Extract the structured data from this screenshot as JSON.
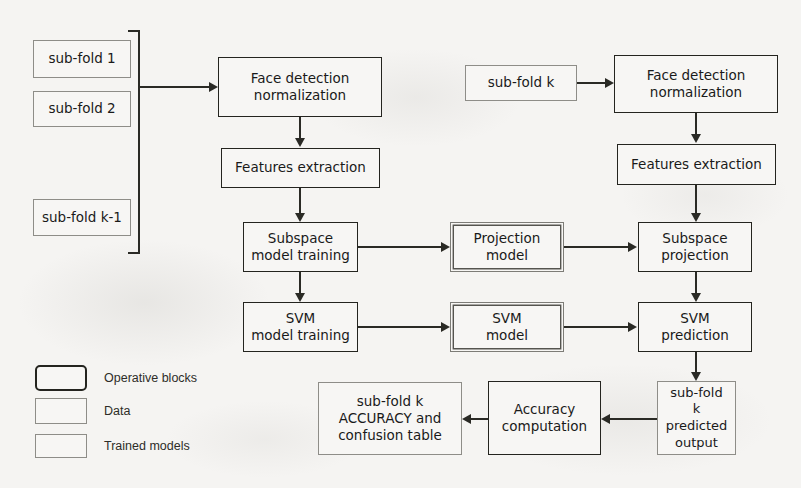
{
  "diagram": {
    "colors": {
      "background": "#f5f4f2",
      "line": "#2a2a25",
      "operative_border": "#24241f",
      "data_border": "#8e8d88",
      "model_border": "#55544f"
    }
  },
  "nodes": {
    "subfold_1": {
      "label": "sub-fold 1",
      "type": "Data"
    },
    "subfold_2": {
      "label": "sub-fold 2",
      "type": "Data"
    },
    "subfold_k_minus_1": {
      "label": "sub-fold k-1",
      "type": "Data"
    },
    "subfold_k": {
      "label": "sub-fold k",
      "type": "Data"
    },
    "train_face_detection": {
      "label": "Face detection\nnormalization",
      "type": "Operative blocks"
    },
    "train_features_extraction": {
      "label": "Features extraction",
      "type": "Operative blocks"
    },
    "subspace_model_training": {
      "label": "Subspace\nmodel training",
      "type": "Operative blocks"
    },
    "svm_model_training": {
      "label": "SVM\nmodel training",
      "type": "Operative blocks"
    },
    "projection_model": {
      "label": "Projection\nmodel",
      "type": "Trained models"
    },
    "svm_model": {
      "label": "SVM\nmodel",
      "type": "Trained models"
    },
    "test_face_detection": {
      "label": "Face detection\nnormalization",
      "type": "Operative blocks"
    },
    "test_features_extraction": {
      "label": "Features extraction",
      "type": "Operative blocks"
    },
    "subspace_projection": {
      "label": "Subspace\nprojection",
      "type": "Operative blocks"
    },
    "svm_prediction": {
      "label": "SVM\nprediction",
      "type": "Operative blocks"
    },
    "predicted_output": {
      "label": "sub-fold\nk\npredicted\noutput",
      "type": "Data"
    },
    "accuracy_computation": {
      "label": "Accuracy\ncomputation",
      "type": "Operative blocks"
    },
    "accuracy_result": {
      "label": "sub-fold k\nACCURACY and\nconfusion table",
      "type": "Data"
    }
  },
  "legend": {
    "items": [
      {
        "label": "Operative blocks",
        "swatch": "operative-swatch"
      },
      {
        "label": "Data",
        "swatch": "data-swatch"
      },
      {
        "label": "Trained models",
        "swatch": "trained-models-swatch"
      }
    ]
  }
}
